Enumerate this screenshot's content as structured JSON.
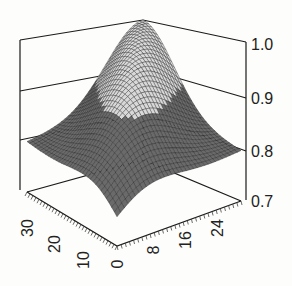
{
  "chart_data": {
    "type": "surface3d",
    "title": "",
    "xlabel": "",
    "ylabel": "",
    "zlabel": "",
    "x_axis": {
      "ticks": [
        0,
        8,
        16,
        24
      ],
      "range": [
        0,
        30
      ]
    },
    "y_axis": {
      "ticks": [
        0,
        10,
        20,
        30
      ],
      "range": [
        0,
        35
      ]
    },
    "z_axis": {
      "ticks": [
        "0.7",
        "0.8",
        "0.9",
        "1.0"
      ],
      "range": [
        0.7,
        1.0
      ]
    },
    "series": [
      {
        "name": "surface",
        "peak": 1.0,
        "min": 0.75,
        "shade_threshold": 0.9
      }
    ],
    "colors": {
      "upper_mesh": "#d8d8d8",
      "lower_fill": "#6a6a6a",
      "grid_line": "#1a1a1a"
    }
  },
  "labels": {
    "z": [
      "1.0",
      "0.9",
      "0.8",
      "0.7"
    ],
    "left": [
      "30",
      "20",
      "10",
      "0"
    ],
    "right": [
      "8",
      "16",
      "24"
    ]
  }
}
